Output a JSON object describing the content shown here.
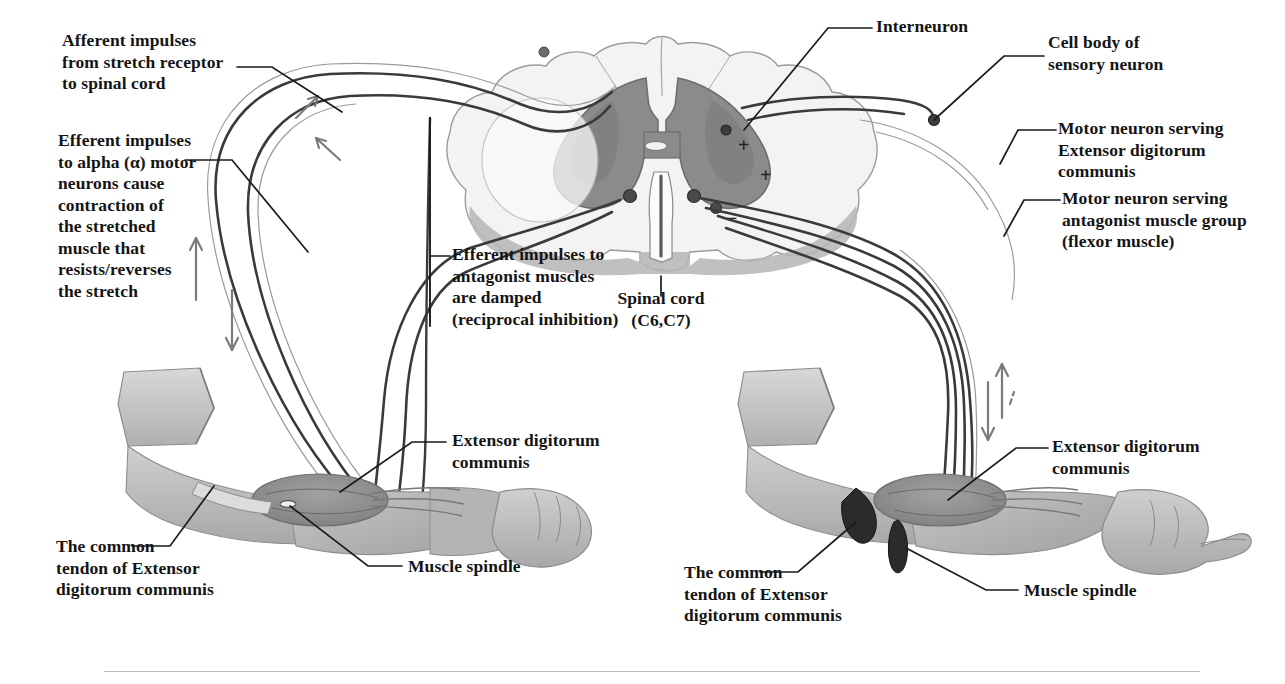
{
  "figure": {
    "type": "anatomical-diagram"
  },
  "labels": {
    "afferent": "Afferent impulses\nfrom stretch receptor\nto spinal cord",
    "efferent_alpha": "Efferent impulses\nto alpha (α) motor\nneurons cause\ncontraction of\nthe stretched\nmuscle that\nresists/reverses\nthe stretch",
    "efferent_antagonist": "Efferent impulses to\nantagonist muscles\nare damped\n(reciprocal inhibition)",
    "spinal_cord": "Spinal cord\n(C6,C7)",
    "interneuron": "Interneuron",
    "cell_body": "Cell body of\nsensory neuron",
    "motor_neuron_edc": "Motor neuron serving\nExtensor digitorum\ncommunis",
    "motor_neuron_antagonist": "Motor neuron serving\nantagonist muscle group\n(flexor muscle)",
    "edc_left": "Extensor digitorum\ncommunis",
    "edc_right": "Extensor digitorum\ncommunis",
    "muscle_spindle_left": "Muscle spindle",
    "muscle_spindle_right": "Muscle spindle",
    "tendon_left": "The common\ntendon of Extensor\ndigitorum communis",
    "tendon_right": "The common\ntendon of Extensor\ndigitorum communis"
  },
  "cord_signs": {
    "plus_upper": "+",
    "plus_lower": "+",
    "minus": "−"
  },
  "colors": {
    "ink": "#141414",
    "nerve": "#3a3a3a",
    "arrow": "#6a6a6a",
    "gray_matter": "#8b8b8b",
    "gray_matter_dark": "#707070",
    "white_matter": "#e2e2e2",
    "skin": "#b9b9b9",
    "skin_dark": "#9a9a9a",
    "muscle": "#8f8f8f",
    "rule": "#b9b9b9"
  }
}
